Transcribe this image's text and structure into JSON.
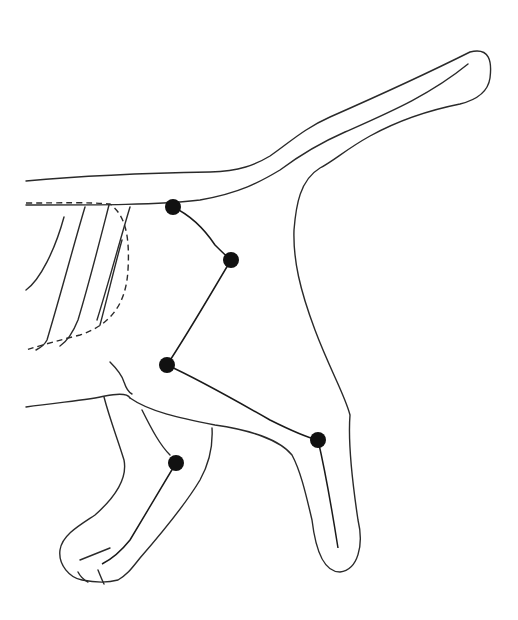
{
  "diagram": {
    "colors": {
      "line": "#2a2a2a",
      "joint": "#111111",
      "background": "#ffffff"
    },
    "joints": [
      {
        "name": "joint-1",
        "cx": 173,
        "cy": 207
      },
      {
        "name": "joint-2",
        "cx": 231,
        "cy": 260
      },
      {
        "name": "joint-3",
        "cx": 167,
        "cy": 365
      },
      {
        "name": "joint-4",
        "cx": 318,
        "cy": 440
      },
      {
        "name": "joint-5",
        "cx": 176,
        "cy": 463
      }
    ]
  }
}
